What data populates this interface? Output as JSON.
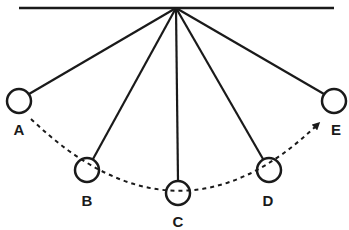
{
  "diagram": {
    "stroke_color": "#1a1a1a",
    "background": "#ffffff",
    "positions": [
      {
        "id": "A",
        "label": "A"
      },
      {
        "id": "B",
        "label": "B"
      },
      {
        "id": "C",
        "label": "C"
      },
      {
        "id": "D",
        "label": "D"
      },
      {
        "id": "E",
        "label": "E"
      }
    ],
    "path_direction": "A to E"
  }
}
